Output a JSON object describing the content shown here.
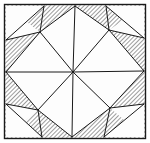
{
  "figure": {
    "type": "line-drawing",
    "width": 150,
    "height": 143,
    "background_color": "#ffffff",
    "stroke_color": "#1a1a1a",
    "hatch_color": "#4a4a4a",
    "white_fill_color": "#fdfdfd",
    "hatch_angle_label": "backslash-45",
    "hatch_spacing_px": 3,
    "stroke_width_px": 1
  },
  "frame": {
    "name": "outer-square-border",
    "x": 4.5,
    "y": 4.5,
    "width": 141,
    "height": 134,
    "stroke_width": 1.4
  },
  "geometry": {
    "center": {
      "x": 73,
      "y": 72
    },
    "corners": {
      "top_left": {
        "x": 6,
        "y": 6
      },
      "top_right": {
        "x": 144,
        "y": 6
      },
      "bottom_right": {
        "x": 144,
        "y": 137
      },
      "bottom_left": {
        "x": 6,
        "y": 137
      }
    },
    "edge_midpoints": {
      "top": {
        "x": 75,
        "y": 6
      },
      "right": {
        "x": 144,
        "y": 71
      },
      "bottom": {
        "x": 72,
        "y": 137
      },
      "left": {
        "x": 6,
        "y": 72
      }
    },
    "inner_star_points": {
      "top_left_inner": {
        "x": 40,
        "y": 32
      },
      "top_right_inner": {
        "x": 109,
        "y": 30
      },
      "bottom_right_inner": {
        "x": 110,
        "y": 108
      },
      "bottom_left_inner": {
        "x": 38,
        "y": 110
      }
    },
    "edge_nodes": {
      "left_upper": {
        "x": 6,
        "y": 40
      },
      "left_lower": {
        "x": 6,
        "y": 104
      },
      "top_left_node": {
        "x": 44,
        "y": 6
      },
      "top_right_node": {
        "x": 106,
        "y": 6
      },
      "right_upper": {
        "x": 144,
        "y": 38
      },
      "right_lower": {
        "x": 144,
        "y": 104
      },
      "bottom_left_node": {
        "x": 42,
        "y": 137
      },
      "bottom_right_node": {
        "x": 104,
        "y": 137
      }
    }
  },
  "white_shapes": [
    {
      "name": "kite-top",
      "points": "75,6 109,30 73,72 40,32"
    },
    {
      "name": "kite-right",
      "points": "144,71 110,108 73,72 109,30"
    },
    {
      "name": "kite-bottom",
      "points": "72,137 38,110 73,72 110,108"
    },
    {
      "name": "kite-left",
      "points": "6,72 40,32 73,72 38,110"
    },
    {
      "name": "corner-triangle-top-left",
      "points": "6,6 44,6 6,40"
    },
    {
      "name": "corner-triangle-top-right",
      "points": "144,6 144,38 106,6"
    },
    {
      "name": "corner-triangle-bottom-right",
      "points": "144,137 104,137 144,104"
    },
    {
      "name": "corner-triangle-bottom-left",
      "points": "6,137 6,104 42,137"
    }
  ],
  "corner_white_wedges": [
    {
      "name": "wedge-top-left",
      "points": "6,6 40,32 6,40"
    },
    {
      "name": "wedge-top-right",
      "points": "144,6 144,38 109,30"
    },
    {
      "name": "wedge-bottom-right",
      "points": "144,137 110,108 144,104"
    },
    {
      "name": "wedge-bottom-left",
      "points": "6,137 6,104 38,110"
    }
  ],
  "radial_lines": [
    {
      "name": "ray-to-top-mid",
      "x2": 75,
      "y2": 6
    },
    {
      "name": "ray-to-right-mid",
      "x2": 144,
      "y2": 71
    },
    {
      "name": "ray-to-bottom-mid",
      "x2": 72,
      "y2": 137
    },
    {
      "name": "ray-to-left-mid",
      "x2": 6,
      "y2": 72
    },
    {
      "name": "ray-to-top-left-inner",
      "x2": 40,
      "y2": 32
    },
    {
      "name": "ray-to-top-right-inner",
      "x2": 109,
      "y2": 30
    },
    {
      "name": "ray-to-bottom-right-inner",
      "x2": 110,
      "y2": 108
    },
    {
      "name": "ray-to-bottom-left-inner",
      "x2": 38,
      "y2": 110
    }
  ],
  "connector_lines": [
    {
      "name": "edge-line-tl-node-to-inner",
      "x1": 44,
      "y1": 6,
      "x2": 40,
      "y2": 32
    },
    {
      "name": "edge-line-left-upper-to-inner",
      "x1": 6,
      "y1": 40,
      "x2": 40,
      "y2": 32
    },
    {
      "name": "edge-line-tr-node-to-inner",
      "x1": 106,
      "y1": 6,
      "x2": 109,
      "y2": 30
    },
    {
      "name": "edge-line-right-upper-to-inner",
      "x1": 144,
      "y1": 38,
      "x2": 109,
      "y2": 30
    },
    {
      "name": "edge-line-br-node-to-inner",
      "x1": 104,
      "y1": 137,
      "x2": 110,
      "y2": 108
    },
    {
      "name": "edge-line-right-lower-to-inner",
      "x1": 144,
      "y1": 104,
      "x2": 110,
      "y2": 108
    },
    {
      "name": "edge-line-bl-node-to-inner",
      "x1": 42,
      "y1": 137,
      "x2": 38,
      "y2": 110
    },
    {
      "name": "edge-line-left-lower-to-inner",
      "x1": 6,
      "y1": 104,
      "x2": 38,
      "y2": 110
    },
    {
      "name": "kite-edge-top-left",
      "x1": 75,
      "y1": 6,
      "x2": 40,
      "y2": 32
    },
    {
      "name": "kite-edge-top-right",
      "x1": 75,
      "y1": 6,
      "x2": 109,
      "y2": 30
    },
    {
      "name": "kite-edge-right-top",
      "x1": 144,
      "y1": 71,
      "x2": 109,
      "y2": 30
    },
    {
      "name": "kite-edge-right-bottom",
      "x1": 144,
      "y1": 71,
      "x2": 110,
      "y2": 108
    },
    {
      "name": "kite-edge-bottom-right",
      "x1": 72,
      "y1": 137,
      "x2": 110,
      "y2": 108
    },
    {
      "name": "kite-edge-bottom-left",
      "x1": 72,
      "y1": 137,
      "x2": 38,
      "y2": 110
    },
    {
      "name": "kite-edge-left-bottom",
      "x1": 6,
      "y1": 72,
      "x2": 38,
      "y2": 110
    },
    {
      "name": "kite-edge-left-top",
      "x1": 6,
      "y1": 72,
      "x2": 40,
      "y2": 32
    },
    {
      "name": "corner-chord-top-left",
      "x1": 44,
      "y1": 6,
      "x2": 6,
      "y2": 40
    },
    {
      "name": "corner-chord-top-right",
      "x1": 106,
      "y1": 6,
      "x2": 144,
      "y2": 38
    },
    {
      "name": "corner-chord-bottom-right",
      "x1": 104,
      "y1": 137,
      "x2": 144,
      "y2": 104
    },
    {
      "name": "corner-chord-bottom-left",
      "x1": 42,
      "y1": 137,
      "x2": 6,
      "y2": 104
    }
  ]
}
